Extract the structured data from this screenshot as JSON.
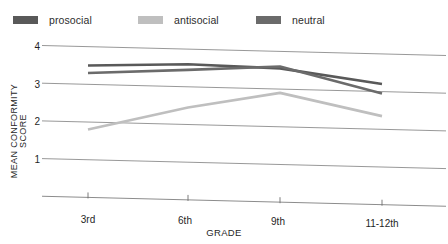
{
  "chart_data": {
    "type": "line",
    "title": "",
    "xlabel": "GRADE",
    "ylabel": "MEAN CONFORMITY SCORE",
    "categories": [
      "3rd",
      "6th",
      "9th",
      "11-12th"
    ],
    "ylim": [
      0,
      4
    ],
    "yticks": [
      "1",
      "2",
      "3",
      "4"
    ],
    "grid": true,
    "legend_position": "top",
    "series": [
      {
        "name": "prosocial",
        "color": "#595959",
        "values": [
          3.5,
          3.6,
          3.55,
          3.2
        ]
      },
      {
        "name": "antisocial",
        "color": "#bfbfbf",
        "values": [
          1.8,
          2.45,
          2.9,
          2.35
        ]
      },
      {
        "name": "neutral",
        "color": "#6b6b6b",
        "values": [
          3.3,
          3.45,
          3.6,
          2.95
        ]
      }
    ]
  },
  "legend": {
    "items": [
      {
        "label": "prosocial",
        "color": "#595959"
      },
      {
        "label": "antisocial",
        "color": "#bfbfbf"
      },
      {
        "label": "neutral",
        "color": "#6b6b6b"
      }
    ]
  },
  "axes": {
    "y_title": "MEAN CONFORMITY SCORE",
    "x_title": "GRADE",
    "y_ticks": [
      "4",
      "3",
      "2",
      "1"
    ],
    "x_ticks": [
      "3rd",
      "6th",
      "9th",
      "11-12th"
    ]
  },
  "colors": {
    "gridline": "#8c8c8c",
    "axis": "#6e6e6e",
    "text": "#1f1f1f",
    "background": "#ffffff"
  }
}
